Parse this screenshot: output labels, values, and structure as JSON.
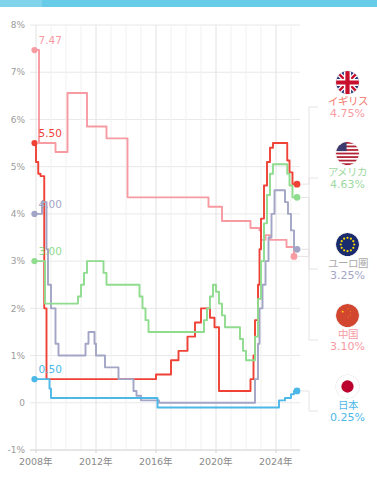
{
  "topbar": {
    "color": "#6fcfe9"
  },
  "chart_data": {
    "type": "line",
    "title": "",
    "subtitle": "",
    "xlabel": "",
    "ylabel": "",
    "grid": true,
    "legend_position": "right",
    "xlim": [
      2007.6,
      2025.6
    ],
    "ylim": [
      -1,
      8
    ],
    "xtick_labels": [
      "2008年",
      "2012年",
      "2016年",
      "2020年",
      "2024年"
    ],
    "xtick_values": [
      2008,
      2012,
      2016,
      2020,
      2024
    ],
    "ytick_labels": [
      "8%",
      "7%",
      "6%",
      "5%",
      "4%",
      "3%",
      "2%",
      "1%",
      "0",
      "-1%"
    ],
    "ytick_values": [
      8,
      7,
      6,
      5,
      4,
      3,
      2,
      1,
      0,
      -1
    ],
    "start_annotations": [
      {
        "label": "7.47",
        "series": "イギリス",
        "color": "#f79aa2",
        "x": 2007.9,
        "y": 7.47
      },
      {
        "label": "5.50",
        "series": "アメリカ",
        "color": "#ef4136",
        "x": 2007.9,
        "y": 5.5
      },
      {
        "label": "4.00",
        "series": "ユーロ圏",
        "color": "#a3a5c6",
        "x": 2007.9,
        "y": 4.0
      },
      {
        "label": "3.00",
        "series": "中国",
        "color": "#8fdc8f",
        "x": 2007.9,
        "y": 3.0
      },
      {
        "label": "0.50",
        "series": "日本",
        "color": "#4cb8e8",
        "x": 2007.9,
        "y": 0.5
      }
    ],
    "series": [
      {
        "name": "イギリス",
        "legend_label": "イギリス",
        "color": "#f79aa2",
        "end_value": "4.75%",
        "end_value_num": 4.75,
        "flag": "uk-flag-icon",
        "points": [
          [
            2007.9,
            7.47
          ],
          [
            2008.15,
            7.47
          ],
          [
            2008.2,
            5.5
          ],
          [
            2009.2,
            5.5
          ],
          [
            2009.3,
            5.31
          ],
          [
            2010.0,
            5.31
          ],
          [
            2010.1,
            6.56
          ],
          [
            2011.3,
            6.56
          ],
          [
            2011.4,
            5.85
          ],
          [
            2012.6,
            5.85
          ],
          [
            2012.7,
            5.6
          ],
          [
            2014.0,
            5.6
          ],
          [
            2014.1,
            4.35
          ],
          [
            2015.0,
            4.35
          ],
          [
            2015.1,
            4.35
          ],
          [
            2016.6,
            4.35
          ],
          [
            2016.7,
            4.35
          ],
          [
            2019.4,
            4.35
          ],
          [
            2019.5,
            4.15
          ],
          [
            2020.3,
            4.15
          ],
          [
            2020.4,
            3.85
          ],
          [
            2021.2,
            3.85
          ],
          [
            2021.3,
            3.85
          ],
          [
            2022.2,
            3.85
          ],
          [
            2022.3,
            3.7
          ],
          [
            2022.8,
            3.7
          ],
          [
            2022.9,
            3.65
          ],
          [
            2023.0,
            3.45
          ],
          [
            2023.2,
            3.45
          ],
          [
            2023.3,
            3.55
          ],
          [
            2023.5,
            3.55
          ],
          [
            2023.6,
            3.45
          ],
          [
            2024.0,
            3.45
          ],
          [
            2024.1,
            3.45
          ],
          [
            2024.6,
            3.45
          ],
          [
            2024.7,
            3.3
          ],
          [
            2025.1,
            3.3
          ],
          [
            2025.2,
            3.1
          ]
        ]
      },
      {
        "name": "アメリカ",
        "legend_label": "アメリカ",
        "color": "#ef4136",
        "end_value": "4.63%",
        "end_value_num": 4.63,
        "flag": "us-flag-icon",
        "points": [
          [
            2007.9,
            5.5
          ],
          [
            2008.0,
            5.1
          ],
          [
            2008.1,
            5.1
          ],
          [
            2008.15,
            4.85
          ],
          [
            2008.25,
            4.85
          ],
          [
            2008.3,
            4.8
          ],
          [
            2008.5,
            4.8
          ],
          [
            2008.55,
            2.0
          ],
          [
            2008.65,
            2.0
          ],
          [
            2008.7,
            0.5
          ],
          [
            2015.9,
            0.5
          ],
          [
            2016.0,
            0.6
          ],
          [
            2016.9,
            0.6
          ],
          [
            2017.0,
            0.9
          ],
          [
            2017.4,
            0.9
          ],
          [
            2017.5,
            1.1
          ],
          [
            2018.0,
            1.1
          ],
          [
            2018.1,
            1.4
          ],
          [
            2018.5,
            1.4
          ],
          [
            2018.6,
            1.7
          ],
          [
            2018.9,
            1.7
          ],
          [
            2019.0,
            2.0
          ],
          [
            2019.5,
            2.0
          ],
          [
            2019.6,
            1.8
          ],
          [
            2019.8,
            1.8
          ],
          [
            2019.9,
            1.6
          ],
          [
            2020.1,
            1.6
          ],
          [
            2020.2,
            0.25
          ],
          [
            2022.2,
            0.25
          ],
          [
            2022.3,
            0.5
          ],
          [
            2022.5,
            1.0
          ],
          [
            2022.6,
            1.75
          ],
          [
            2022.8,
            2.5
          ],
          [
            2022.9,
            3.25
          ],
          [
            2023.0,
            3.9
          ],
          [
            2023.2,
            4.6
          ],
          [
            2023.4,
            5.1
          ],
          [
            2023.6,
            5.4
          ],
          [
            2023.8,
            5.5
          ],
          [
            2024.6,
            5.5
          ],
          [
            2024.75,
            5.13
          ],
          [
            2024.9,
            4.88
          ],
          [
            2025.1,
            4.63
          ],
          [
            2025.4,
            4.63
          ]
        ]
      },
      {
        "name": "ユーロ圏",
        "legend_label": "ユーロ圏",
        "color": "#a3a5c6",
        "end_value": "3.25%",
        "end_value_num": 3.25,
        "flag": "eu-flag-icon",
        "points": [
          [
            2007.9,
            4.0
          ],
          [
            2008.3,
            4.0
          ],
          [
            2008.4,
            4.25
          ],
          [
            2008.6,
            4.25
          ],
          [
            2008.7,
            3.25
          ],
          [
            2008.8,
            2.5
          ],
          [
            2009.0,
            2.0
          ],
          [
            2009.3,
            1.25
          ],
          [
            2009.5,
            1.0
          ],
          [
            2011.0,
            1.0
          ],
          [
            2011.3,
            1.25
          ],
          [
            2011.5,
            1.5
          ],
          [
            2011.8,
            1.5
          ],
          [
            2011.9,
            1.25
          ],
          [
            2012.0,
            1.0
          ],
          [
            2012.5,
            1.0
          ],
          [
            2012.6,
            0.75
          ],
          [
            2013.4,
            0.75
          ],
          [
            2013.5,
            0.5
          ],
          [
            2014.4,
            0.5
          ],
          [
            2014.5,
            0.25
          ],
          [
            2014.7,
            0.15
          ],
          [
            2015.0,
            0.05
          ],
          [
            2016.1,
            0.05
          ],
          [
            2016.2,
            0.0
          ],
          [
            2022.5,
            0.0
          ],
          [
            2022.6,
            0.5
          ],
          [
            2022.8,
            1.25
          ],
          [
            2022.9,
            2.0
          ],
          [
            2023.1,
            2.5
          ],
          [
            2023.3,
            3.0
          ],
          [
            2023.5,
            3.5
          ],
          [
            2023.7,
            4.0
          ],
          [
            2023.9,
            4.5
          ],
          [
            2024.0,
            4.5
          ],
          [
            2024.5,
            4.5
          ],
          [
            2024.6,
            4.25
          ],
          [
            2024.8,
            4.0
          ],
          [
            2025.0,
            3.65
          ],
          [
            2025.2,
            3.25
          ],
          [
            2025.4,
            3.25
          ]
        ]
      },
      {
        "name": "中国",
        "legend_label": "中国",
        "color": "#8fdc8f",
        "end_value": "3.10%",
        "end_value_num": 3.1,
        "flag": "cn-flag-icon",
        "points": [
          [
            2007.9,
            3.0
          ],
          [
            2008.5,
            3.0
          ],
          [
            2008.6,
            2.1
          ],
          [
            2010.7,
            2.1
          ],
          [
            2010.8,
            2.25
          ],
          [
            2011.0,
            2.5
          ],
          [
            2011.2,
            2.75
          ],
          [
            2011.4,
            3.0
          ],
          [
            2011.6,
            3.0
          ],
          [
            2012.4,
            3.0
          ],
          [
            2012.5,
            2.75
          ],
          [
            2012.7,
            2.5
          ],
          [
            2013.0,
            2.5
          ],
          [
            2014.8,
            2.5
          ],
          [
            2014.9,
            2.25
          ],
          [
            2015.1,
            2.0
          ],
          [
            2015.3,
            1.75
          ],
          [
            2015.5,
            1.5
          ],
          [
            2015.8,
            1.5
          ],
          [
            2016.5,
            1.5
          ],
          [
            2016.6,
            1.5
          ],
          [
            2019.0,
            1.5
          ],
          [
            2019.2,
            1.75
          ],
          [
            2019.4,
            2.0
          ],
          [
            2019.6,
            2.25
          ],
          [
            2019.8,
            2.5
          ],
          [
            2020.0,
            2.35
          ],
          [
            2020.2,
            2.1
          ],
          [
            2020.4,
            1.85
          ],
          [
            2020.6,
            1.6
          ],
          [
            2020.8,
            1.6
          ],
          [
            2021.5,
            1.6
          ],
          [
            2021.6,
            1.35
          ],
          [
            2021.8,
            1.1
          ],
          [
            2022.0,
            0.9
          ],
          [
            2022.3,
            0.9
          ],
          [
            2022.5,
            0.9
          ],
          [
            2022.6,
            1.4
          ],
          [
            2022.8,
            2.2
          ],
          [
            2023.0,
            3.0
          ],
          [
            2023.2,
            3.8
          ],
          [
            2023.4,
            4.4
          ],
          [
            2023.6,
            4.85
          ],
          [
            2023.8,
            5.05
          ],
          [
            2024.0,
            5.05
          ],
          [
            2024.6,
            5.05
          ],
          [
            2024.75,
            4.85
          ],
          [
            2024.9,
            4.6
          ],
          [
            2025.1,
            4.35
          ],
          [
            2025.4,
            4.35
          ]
        ]
      },
      {
        "name": "日本",
        "legend_label": "日本",
        "color": "#4cb8e8",
        "end_value": "0.25%",
        "end_value_num": 0.25,
        "flag": "jp-flag-icon",
        "points": [
          [
            2007.9,
            0.5
          ],
          [
            2008.8,
            0.5
          ],
          [
            2008.9,
            0.3
          ],
          [
            2009.0,
            0.1
          ],
          [
            2009.2,
            0.1
          ],
          [
            2016.0,
            0.1
          ],
          [
            2016.1,
            -0.1
          ],
          [
            2024.1,
            -0.1
          ],
          [
            2024.2,
            0.05
          ],
          [
            2024.5,
            0.05
          ],
          [
            2024.6,
            0.1
          ],
          [
            2024.9,
            0.1
          ],
          [
            2025.0,
            0.18
          ],
          [
            2025.2,
            0.25
          ],
          [
            2025.4,
            0.25
          ]
        ]
      }
    ]
  },
  "legend": {
    "items": [
      {
        "flag": "uk-flag-icon",
        "name": "イギリス",
        "value": "4.75%",
        "name_color": "#f4786e",
        "value_color": "#f79aa2",
        "top": 64
      },
      {
        "flag": "us-flag-icon",
        "name": "アメリカ",
        "value": "4.63%",
        "name_color": "#9fd99f",
        "value_color": "#9fd99f",
        "top": 135
      },
      {
        "flag": "eu-flag-icon",
        "name": "ユーロ圏",
        "value": "3.25%",
        "name_color": "#aaaaaa",
        "value_color": "#a3a5c6",
        "top": 226
      },
      {
        "flag": "cn-flag-icon",
        "name": "中国",
        "value": "3.10%",
        "name_color": "#f79aa2",
        "value_color": "#f79aa2",
        "top": 297
      },
      {
        "flag": "jp-flag-icon",
        "name": "日本",
        "value": "0.25%",
        "name_color": "#4cb8e8",
        "value_color": "#4cb8e8",
        "top": 368
      }
    ]
  }
}
